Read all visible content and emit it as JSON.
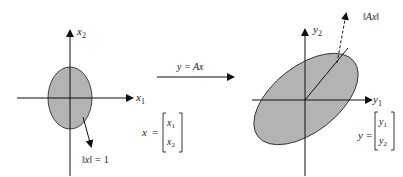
{
  "figure": {
    "transform_label": "y = Ax",
    "left": {
      "axis_h_label": "x",
      "axis_h_sub": "1",
      "axis_v_label": "x",
      "axis_v_sub": "2",
      "norm_label_pre": "‖x‖ = ",
      "norm_label_value": "1",
      "vector_name": "x",
      "vector_eq": "=",
      "vector_entries": [
        {
          "sym": "x",
          "sub": "1"
        },
        {
          "sym": "x",
          "sub": "2"
        }
      ],
      "ellipse_fill": "#b3b3b3"
    },
    "right": {
      "axis_h_label": "y",
      "axis_h_sub": "1",
      "axis_v_label": "y",
      "axis_v_sub": "2",
      "norm_label": "‖Ax‖",
      "vector_name": "y",
      "vector_eq": "=",
      "vector_entries": [
        {
          "sym": "y",
          "sub": "1"
        },
        {
          "sym": "y",
          "sub": "2"
        }
      ],
      "ellipse_fill": "#b3b3b3"
    }
  }
}
